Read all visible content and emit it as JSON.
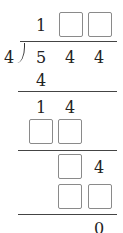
{
  "problem": {
    "divisor": "4",
    "dividend": [
      "5",
      "4",
      "4"
    ],
    "quotient": [
      {
        "value": "1",
        "blank": false
      },
      {
        "value": "",
        "blank": true
      },
      {
        "value": "",
        "blank": true
      }
    ],
    "steps": [
      {
        "row": "subtract-1",
        "cells": [
          {
            "value": "4",
            "blank": false
          }
        ]
      },
      {
        "row": "remainder-1",
        "cells": [
          {
            "value": "1",
            "blank": false
          },
          {
            "value": "4",
            "blank": false
          }
        ]
      },
      {
        "row": "subtract-2",
        "cells": [
          {
            "value": "",
            "blank": true
          },
          {
            "value": "",
            "blank": true
          }
        ]
      },
      {
        "row": "remainder-2",
        "cells": [
          {
            "value": "",
            "blank": true
          },
          {
            "value": "4",
            "blank": false
          }
        ]
      },
      {
        "row": "subtract-3",
        "cells": [
          {
            "value": "",
            "blank": true
          },
          {
            "value": "",
            "blank": true
          }
        ]
      },
      {
        "row": "final-remainder",
        "cells": [
          {
            "value": "0",
            "blank": false
          }
        ]
      }
    ]
  }
}
